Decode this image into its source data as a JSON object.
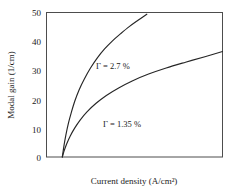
{
  "chart_data": {
    "type": "line",
    "title": "",
    "xlabel": "Current density (A/cm²)",
    "ylabel": "Modal gain (1/cm)",
    "grid": false,
    "legend_position": "inline-annotations",
    "xlim": [
      0,
      100
    ],
    "ylim": [
      0,
      50
    ],
    "x_tick_labels": [],
    "y_tick_labels": [
      "0",
      "10",
      "20",
      "30",
      "40",
      "50"
    ],
    "y_ticks": [
      0,
      10,
      20,
      30,
      40,
      50
    ],
    "transparency_current": 9,
    "series": [
      {
        "name": "Γ = 2.7 %",
        "label": "Γ = 2.7 %",
        "confinement_factor_percent": 2.7,
        "color": "#262626",
        "x": [
          9,
          10,
          11,
          12.5,
          14,
          16,
          18.5,
          21.5,
          25,
          29,
          33,
          37.5,
          42,
          47,
          52,
          57
        ],
        "y": [
          0,
          4.2,
          7.6,
          11.8,
          15.2,
          19.2,
          23.2,
          27.0,
          30.8,
          34.4,
          37.4,
          40.2,
          42.6,
          45.1,
          47.3,
          49.4
        ]
      },
      {
        "name": "Γ = 1.35 %",
        "label": "Γ = 1.35 %",
        "confinement_factor_percent": 1.35,
        "color": "#262626",
        "x": [
          9,
          10,
          11.5,
          13.5,
          16,
          19,
          23,
          28,
          34,
          41,
          49,
          58,
          68,
          79,
          90,
          100
        ],
        "y": [
          0,
          2.1,
          4.6,
          7.3,
          10.0,
          12.7,
          15.6,
          18.5,
          21.3,
          23.9,
          26.4,
          28.7,
          30.8,
          32.8,
          34.7,
          36.5
        ]
      }
    ],
    "annotations": [
      {
        "text": "Γ = 2.7 %",
        "target_series": "Γ = 2.7 %"
      },
      {
        "text": "Γ = 1.35 %",
        "target_series": "Γ = 1.35 %"
      }
    ]
  },
  "axes": {
    "y_title": "Modal gain (1/cm)",
    "x_title": "Current density (A/cm²)",
    "y_labels": {
      "t0": "0",
      "t1": "10",
      "t2": "20",
      "t3": "30",
      "t4": "40",
      "t5": "50"
    }
  },
  "annotations": {
    "upper": "Γ = 2.7 %",
    "lower": "Γ = 1.35 %"
  },
  "colors": {
    "curve": "#262626",
    "frame": "#4d4d4d",
    "text": "#1a1a1a",
    "background": "#ffffff"
  }
}
